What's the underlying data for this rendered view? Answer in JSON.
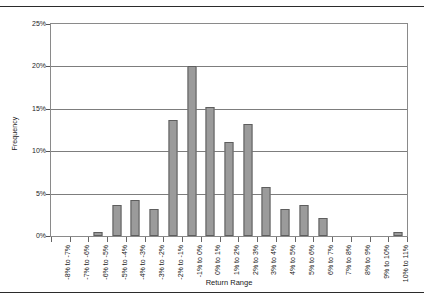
{
  "chart_data": {
    "type": "bar",
    "title": "",
    "subtitle": "",
    "xlabel": "Return Range",
    "ylabel": "Frequency",
    "ylim": [
      0,
      25
    ],
    "ytick_labels": [
      "25%",
      "20%",
      "15%",
      "10%",
      "5%",
      "0%"
    ],
    "ytick_values": [
      25,
      20,
      15,
      10,
      5,
      0
    ],
    "grid": true,
    "legend": "none",
    "bar_color": "#9b9b9b",
    "bar_edge_color": "#5e5e5e",
    "categories": [
      "-8% to -7%",
      "-7% to -6%",
      "-6% to -5%",
      "-5% to -4%",
      "-4% to -3%",
      "-3% to -2%",
      "-2% to -1%",
      "-1% to 0%",
      "0% to 1%",
      "1% to 2%",
      "2% to 3%",
      "3% to 4%",
      "4% to 5%",
      "5% to 6%",
      "6% to 7%",
      "7% to 8%",
      "8% to 9%",
      "9% to 10%",
      "10% to 11%"
    ],
    "values": [
      0,
      0,
      0.5,
      3.7,
      4.2,
      3.2,
      13.7,
      20.0,
      15.2,
      11.1,
      13.2,
      5.8,
      3.2,
      3.7,
      2.1,
      0,
      0,
      0,
      0.5
    ]
  }
}
